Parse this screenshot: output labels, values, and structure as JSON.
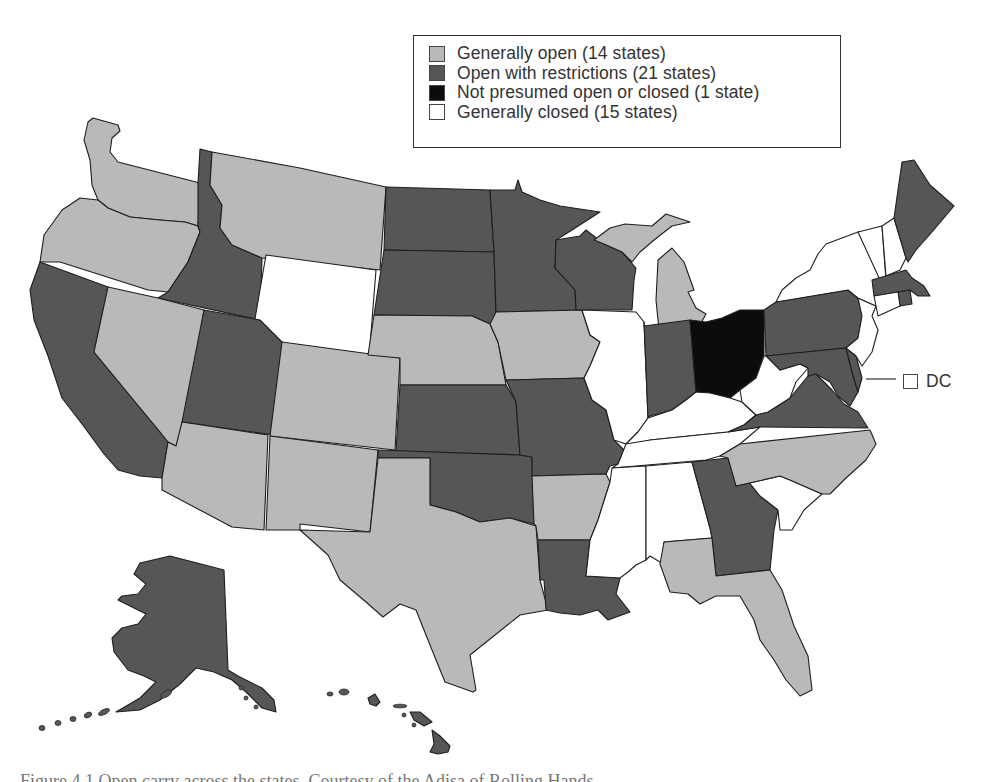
{
  "colors": {
    "generally_open": "#b9b9b9",
    "open_with_restrictions": "#565656",
    "not_presumed": "#0c0c0c",
    "generally_closed": "#ffffff",
    "border": "#1e1e1e"
  },
  "legend": {
    "items": [
      {
        "category": "generally_open",
        "label": "Generally open (14 states)",
        "count": 14,
        "color": "#b9b9b9"
      },
      {
        "category": "open_with_restrictions",
        "label": "Open with restrictions (21 states)",
        "count": 21,
        "color": "#565656"
      },
      {
        "category": "not_presumed",
        "label": "Not presumed open or closed (1 state)",
        "count": 1,
        "color": "#0c0c0c"
      },
      {
        "category": "generally_closed",
        "label": "Generally closed (15 states)",
        "count": 15,
        "color": "#ffffff"
      }
    ]
  },
  "dc_callout": {
    "label": "DC",
    "category": "generally_closed"
  },
  "states": {
    "WA": "generally_open",
    "OR": "generally_open",
    "CA": "open_with_restrictions",
    "ID": "open_with_restrictions",
    "NV": "generally_open",
    "MT": "generally_open",
    "WY": "generally_closed",
    "UT": "open_with_restrictions",
    "AZ": "generally_open",
    "CO": "generally_open",
    "NM": "generally_open",
    "ND": "open_with_restrictions",
    "SD": "open_with_restrictions",
    "NE": "generally_open",
    "KS": "open_with_restrictions",
    "OK": "open_with_restrictions",
    "TX": "generally_open",
    "MN": "open_with_restrictions",
    "IA": "generally_open",
    "MO": "open_with_restrictions",
    "AR": "generally_open",
    "LA": "open_with_restrictions",
    "WI": "open_with_restrictions",
    "IL": "generally_closed",
    "MI": "generally_open",
    "IN": "open_with_restrictions",
    "OH": "not_presumed",
    "KY": "generally_closed",
    "TN": "generally_closed",
    "MS": "generally_closed",
    "AL": "generally_closed",
    "GA": "open_with_restrictions",
    "FL": "generally_open",
    "SC": "generally_closed",
    "NC": "generally_open",
    "VA": "open_with_restrictions",
    "WV": "generally_closed",
    "PA": "open_with_restrictions",
    "NY": "generally_closed",
    "VT": "generally_closed",
    "NH": "generally_closed",
    "ME": "open_with_restrictions",
    "MA": "open_with_restrictions",
    "RI": "open_with_restrictions",
    "CT": "generally_closed",
    "NJ": "generally_closed",
    "DE": "open_with_restrictions",
    "MD": "open_with_restrictions",
    "AK": "open_with_restrictions",
    "HI": "open_with_restrictions"
  },
  "caption": "Figure 4.1   Open carry across the states. Courtesy of the Adisa of Rolling Hands"
}
